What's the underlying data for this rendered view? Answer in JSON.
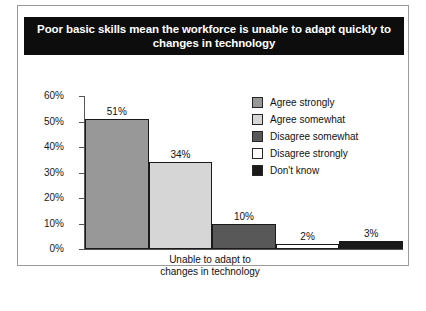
{
  "chart_data": {
    "type": "bar",
    "title": "Poor basic skills mean the workforce is unable to adapt quickly to changes in technology",
    "xlabel": "Unable to adapt to changes in technology",
    "xlabel_lines": [
      "Unable to adapt to",
      "changes in technology"
    ],
    "ylabel": "",
    "ylim": [
      0,
      60
    ],
    "ytick_values": [
      0,
      10,
      20,
      30,
      40,
      50,
      60
    ],
    "ytick_labels": [
      "0%",
      "10%",
      "20%",
      "30%",
      "40%",
      "50%",
      "60%"
    ],
    "categories": [
      "Agree strongly",
      "Agree somewhat",
      "Disagree somewhat",
      "Disagree strongly",
      "Don't know"
    ],
    "values": [
      51,
      34,
      10,
      2,
      3
    ],
    "value_labels": [
      "51%",
      "34%",
      "10%",
      "2%",
      "3%"
    ],
    "colors": [
      "#989898",
      "#d6d6d6",
      "#585858",
      "#ffffff",
      "#1a1a1a"
    ],
    "bar_edge_color": "#1a1a1a",
    "grid": false,
    "legend_position": "upper-right",
    "legend": [
      {
        "label": "Agree strongly",
        "color": "#989898"
      },
      {
        "label": "Agree somewhat",
        "color": "#d6d6d6"
      },
      {
        "label": "Disagree somewhat",
        "color": "#585858"
      },
      {
        "label": "Disagree strongly",
        "color": "#ffffff"
      },
      {
        "label": "Don't know",
        "color": "#1a1a1a"
      }
    ]
  },
  "banner": {
    "background": "#0d0d0d",
    "text_color": "#ffffff"
  }
}
